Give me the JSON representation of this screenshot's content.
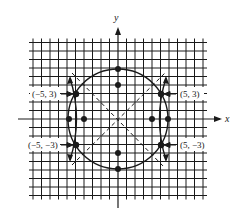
{
  "diagram": {
    "type": "coordinate-graph",
    "axes": {
      "x_label": "x",
      "y_label": "y"
    },
    "grid": {
      "x_range": [
        -10,
        10
      ],
      "y_range": [
        -9,
        9
      ],
      "unit": 1
    },
    "curves": [
      {
        "name": "circle",
        "equation": "x^2 + y^2 = 34",
        "style": "solid"
      },
      {
        "name": "hyperbola",
        "equation": "x^2/16 - y^2/16 = 1 (approx.)",
        "style": "solid"
      },
      {
        "name": "asymptote-1",
        "equation": "y = x",
        "style": "dashed"
      },
      {
        "name": "asymptote-2",
        "equation": "y = -x",
        "style": "dashed"
      }
    ],
    "intersection_points": [
      {
        "label": "(−5, 3)",
        "x": -5,
        "y": 3
      },
      {
        "label": "(5, 3)",
        "x": 5,
        "y": 3
      },
      {
        "label": "(−5, −3)",
        "x": -5,
        "y": -3
      },
      {
        "label": "(5, −3)",
        "x": 5,
        "y": -3
      }
    ],
    "marked_points": [
      {
        "x": 0,
        "y": 5.83
      },
      {
        "x": 0,
        "y": 4
      },
      {
        "x": 0,
        "y": -4
      },
      {
        "x": 0,
        "y": -5.83
      },
      {
        "x": -5.83,
        "y": 0
      },
      {
        "x": -4,
        "y": 0
      },
      {
        "x": 4,
        "y": 0
      },
      {
        "x": 5.83,
        "y": 0
      }
    ],
    "colors": {
      "ink": "#1a1a1a",
      "background": "#ffffff"
    }
  }
}
